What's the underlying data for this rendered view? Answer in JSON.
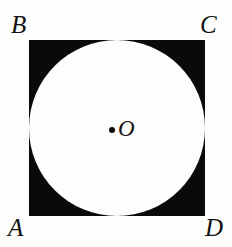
{
  "figure": {
    "background_color": "#fdfdfc",
    "shape_fill_color": "#0a0a0a",
    "circle_fill_color": "#fdfdfc",
    "label_color": "#121212",
    "square": {
      "name": "ABCD",
      "x": 29,
      "y": 40,
      "width": 176,
      "height": 176
    },
    "circle": {
      "center_x": 117,
      "center_y": 128,
      "radius": 88,
      "inscribed": "tangent to all four sides"
    },
    "center_point": {
      "label": "O",
      "dot_x": 112,
      "dot_y": 130,
      "dot_diameter": 6
    },
    "vertex_labels": {
      "top_left": "B",
      "top_right": "C",
      "bottom_left": "A",
      "bottom_right": "D"
    }
  }
}
